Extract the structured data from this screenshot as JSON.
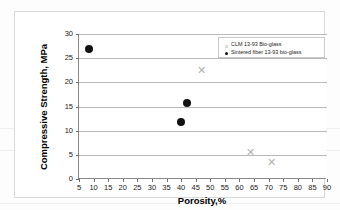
{
  "chart_data": {
    "type": "scatter",
    "title": "",
    "xlabel": "Porosity,%",
    "ylabel": "Compressive Strength, MPa",
    "xlim": [
      5,
      90
    ],
    "ylim": [
      0,
      30
    ],
    "xticks": [
      5,
      10,
      15,
      20,
      25,
      30,
      35,
      40,
      45,
      50,
      55,
      60,
      65,
      70,
      75,
      80,
      85,
      90
    ],
    "yticks": [
      0,
      5,
      10,
      15,
      20,
      25,
      30
    ],
    "grid": "horizontal",
    "legend_position": "top-right",
    "series": [
      {
        "name": "CLM 13-93 Bio-glass",
        "marker": "x",
        "color": "#b0b0b0",
        "points": [
          {
            "x": 47,
            "y": 22.5
          },
          {
            "x": 64,
            "y": 5.5
          },
          {
            "x": 71,
            "y": 3.5
          }
        ]
      },
      {
        "name": "Sintered fiber 13-93 bio-glass",
        "marker": "filled-circle",
        "color": "#111111",
        "points": [
          {
            "x": 8.5,
            "y": 27.0
          },
          {
            "x": 42,
            "y": 15.8
          },
          {
            "x": 40,
            "y": 11.8
          }
        ]
      }
    ]
  },
  "legend": {
    "items": [
      {
        "label": "CLM 13-93 Bio-glass",
        "key": "x-marker-key"
      },
      {
        "label": "Sintered fiber 13-93 bio-glass",
        "key": "dot-marker-key"
      }
    ]
  }
}
